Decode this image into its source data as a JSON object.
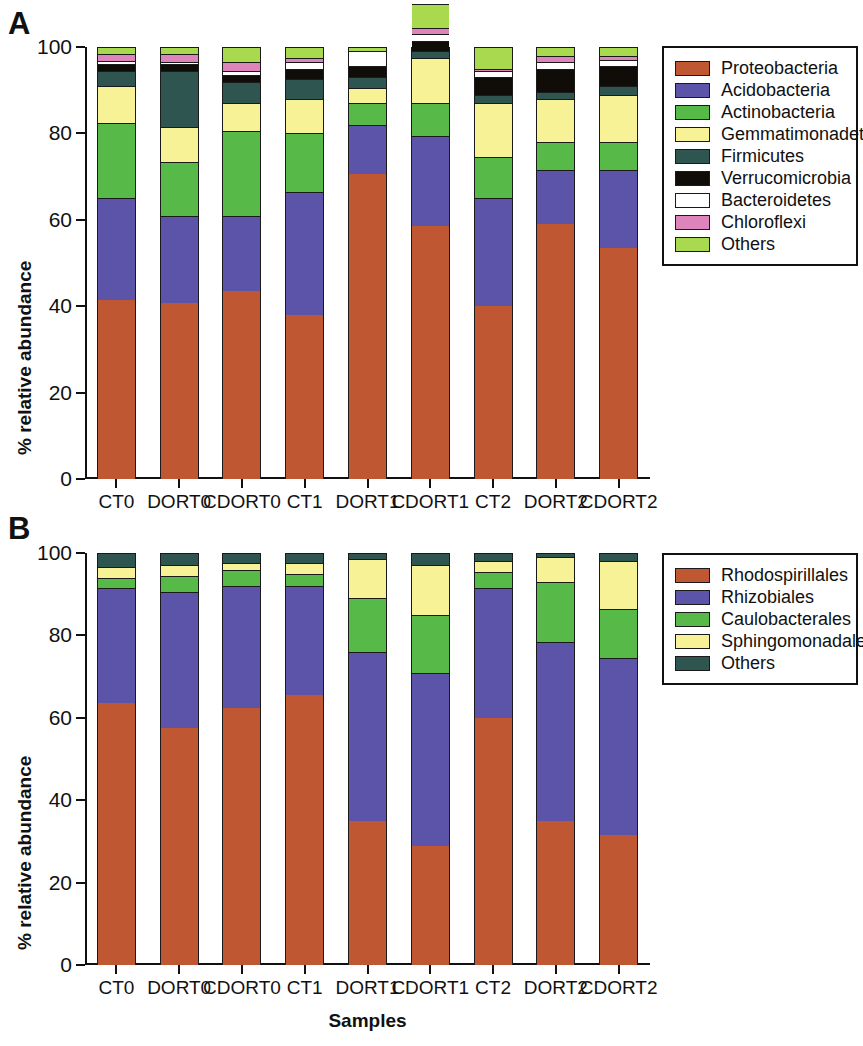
{
  "figure": {
    "panels": [
      {
        "id": "A",
        "letter": "A",
        "ylabel": "% relative abundance",
        "xlabel": "",
        "legend_title": ""
      },
      {
        "id": "B",
        "letter": "B",
        "ylabel": "% relative abundance",
        "xlabel": "Samples",
        "legend_title": ""
      }
    ]
  },
  "colors": {
    "proteobacteria": "#bf5733",
    "acidobacteria": "#5b54a8",
    "actinobacteria": "#57b948",
    "gemmatimonadetes": "#f7f296",
    "firmicutes": "#2f5550",
    "verrucomicrobia": "#100c08",
    "bacteroidetes": "#ffffff",
    "chloroflexi": "#dd85bb",
    "others_a": "#a8d94e",
    "rhodospirillales": "#bf5733",
    "rhizobiales": "#5b54a8",
    "caulobacterales": "#57b948",
    "sphingomonadales": "#f7f296",
    "others_b": "#2f5550"
  },
  "chart_data": [
    {
      "type": "bar",
      "panel": "A",
      "stacked": true,
      "title": "",
      "xlabel": "",
      "ylabel": "% relative abundance",
      "ylim": [
        0,
        100
      ],
      "yticks": [
        "0",
        "20",
        "40",
        "60",
        "80",
        "100"
      ],
      "ytick_values": [
        0,
        20,
        40,
        60,
        80,
        100
      ],
      "grid": false,
      "legend_position": "right",
      "categories": [
        "CT0",
        "DORT0",
        "CDORT0",
        "CT1",
        "DORT1",
        "CDORT1",
        "CT2",
        "DORT2",
        "CDORT2"
      ],
      "series": [
        {
          "name": "Proteobacteria",
          "color_key": "proteobacteria",
          "values": [
            41.5,
            40.8,
            43.5,
            38.0,
            70.5,
            58.5,
            40.0,
            59.0,
            53.5
          ]
        },
        {
          "name": "Acidobacteria",
          "color_key": "acidobacteria",
          "values": [
            23.5,
            20.2,
            17.5,
            28.5,
            11.5,
            21.0,
            25.0,
            12.5,
            18.0
          ]
        },
        {
          "name": "Actinobacteria",
          "color_key": "actinobacteria",
          "values": [
            17.5,
            12.5,
            19.5,
            13.5,
            5.0,
            7.5,
            9.5,
            6.5,
            6.5
          ]
        },
        {
          "name": "Gemmatimonadetes",
          "color_key": "gemmatimonadetes",
          "values": [
            8.5,
            8.0,
            6.5,
            8.0,
            3.5,
            10.5,
            12.5,
            10.0,
            11.0
          ]
        },
        {
          "name": "Firmicutes",
          "color_key": "firmicutes",
          "values": [
            3.5,
            13.0,
            5.0,
            4.5,
            2.5,
            1.5,
            2.0,
            1.5,
            2.0
          ]
        },
        {
          "name": "Verrucomicrobia",
          "color_key": "verrucomicrobia",
          "values": [
            1.5,
            1.5,
            1.5,
            2.5,
            2.5,
            2.5,
            4.0,
            5.5,
            4.5
          ]
        },
        {
          "name": "Bacteroidetes",
          "color_key": "bacteroidetes",
          "values": [
            0.8,
            0.5,
            1.0,
            1.5,
            3.5,
            1.5,
            1.5,
            1.5,
            1.5
          ]
        },
        {
          "name": "Chloroflexi",
          "color_key": "chloroflexi",
          "values": [
            1.7,
            2.0,
            2.0,
            1.0,
            0.0,
            1.5,
            0.5,
            1.5,
            1.0
          ]
        },
        {
          "name": "Others",
          "color_key": "others_a",
          "values": [
            1.5,
            1.5,
            3.5,
            2.5,
            1.0,
            5.5,
            5.0,
            2.0,
            2.0
          ]
        }
      ]
    },
    {
      "type": "bar",
      "panel": "B",
      "stacked": true,
      "title": "",
      "xlabel": "Samples",
      "ylabel": "% relative abundance",
      "ylim": [
        0,
        100
      ],
      "yticks": [
        "0",
        "20",
        "40",
        "60",
        "80",
        "100"
      ],
      "ytick_values": [
        0,
        20,
        40,
        60,
        80,
        100
      ],
      "grid": false,
      "legend_position": "right",
      "categories": [
        "CT0",
        "DORT0",
        "CDORT0",
        "CT1",
        "DORT1",
        "CDORT1",
        "CT2",
        "DORT2",
        "CDORT2"
      ],
      "series": [
        {
          "name": "Rhodospirillales",
          "color_key": "rhodospirillales",
          "values": [
            63.5,
            57.5,
            62.5,
            65.5,
            35.0,
            29.0,
            60.0,
            35.0,
            31.5
          ]
        },
        {
          "name": "Rhizobiales",
          "color_key": "rhizobiales",
          "values": [
            28.0,
            33.0,
            29.5,
            26.5,
            41.0,
            42.0,
            31.5,
            43.5,
            43.0
          ]
        },
        {
          "name": "Caulobacterales",
          "color_key": "caulobacterales",
          "values": [
            2.5,
            4.0,
            4.0,
            3.0,
            13.0,
            14.0,
            4.0,
            14.5,
            12.0
          ]
        },
        {
          "name": "Sphingomonadales",
          "color_key": "sphingomonadales",
          "values": [
            2.5,
            2.5,
            1.5,
            2.5,
            9.5,
            12.0,
            2.5,
            6.0,
            11.5
          ]
        },
        {
          "name": "Others",
          "color_key": "others_b",
          "values": [
            3.5,
            3.0,
            2.5,
            2.5,
            1.5,
            3.0,
            2.0,
            1.0,
            2.0
          ]
        }
      ]
    }
  ],
  "legends": {
    "a": {
      "items": [
        {
          "label": "Proteobacteria",
          "color_key": "proteobacteria"
        },
        {
          "label": "Acidobacteria",
          "color_key": "acidobacteria"
        },
        {
          "label": "Actinobacteria",
          "color_key": "actinobacteria"
        },
        {
          "label": "Gemmatimonadetes",
          "color_key": "gemmatimonadetes"
        },
        {
          "label": "Firmicutes",
          "color_key": "firmicutes"
        },
        {
          "label": "Verrucomicrobia",
          "color_key": "verrucomicrobia"
        },
        {
          "label": "Bacteroidetes",
          "color_key": "bacteroidetes"
        },
        {
          "label": "Chloroflexi",
          "color_key": "chloroflexi"
        },
        {
          "label": "Others",
          "color_key": "others_a"
        }
      ]
    },
    "b": {
      "items": [
        {
          "label": "Rhodospirillales",
          "color_key": "rhodospirillales"
        },
        {
          "label": "Rhizobiales",
          "color_key": "rhizobiales"
        },
        {
          "label": "Caulobacterales",
          "color_key": "caulobacterales"
        },
        {
          "label": "Sphingomonadales",
          "color_key": "sphingomonadales"
        },
        {
          "label": "Others",
          "color_key": "others_b"
        }
      ]
    }
  }
}
